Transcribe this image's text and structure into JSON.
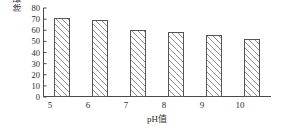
{
  "chart_data": {
    "type": "bar",
    "title": "",
    "subtitle": "",
    "xlabel": "pH值",
    "ylabel": "除磷率（%）",
    "categories": [
      "5",
      "6",
      "7",
      "8",
      "9",
      "10"
    ],
    "values": [
      71,
      69,
      60,
      58,
      55.5,
      52.5
    ],
    "series": [
      {
        "name": "除磷率",
        "values": [
          71,
          69,
          60,
          58,
          55.5,
          52.5
        ]
      }
    ],
    "ylim": [
      0,
      80
    ],
    "yticks": [
      0,
      10,
      20,
      30,
      40,
      50,
      60,
      70,
      80
    ],
    "ytick_labels": [
      "0",
      "10",
      "20",
      "30",
      "40",
      "50",
      "60",
      "70",
      "80"
    ],
    "xtick_labels": [
      "5",
      "6",
      "7",
      "8",
      "9",
      "10"
    ],
    "grid": false,
    "legend": false,
    "legend_position": "none",
    "bar_fill": "hatched-diagonal",
    "bar_edge_color": "#555555",
    "bar_face_color": "#ffffff",
    "hatch_color": "#8f8f8f",
    "background_color": "#ffffff",
    "axis_color": "#4a4a4a",
    "text_color": "#2b2b2b"
  }
}
